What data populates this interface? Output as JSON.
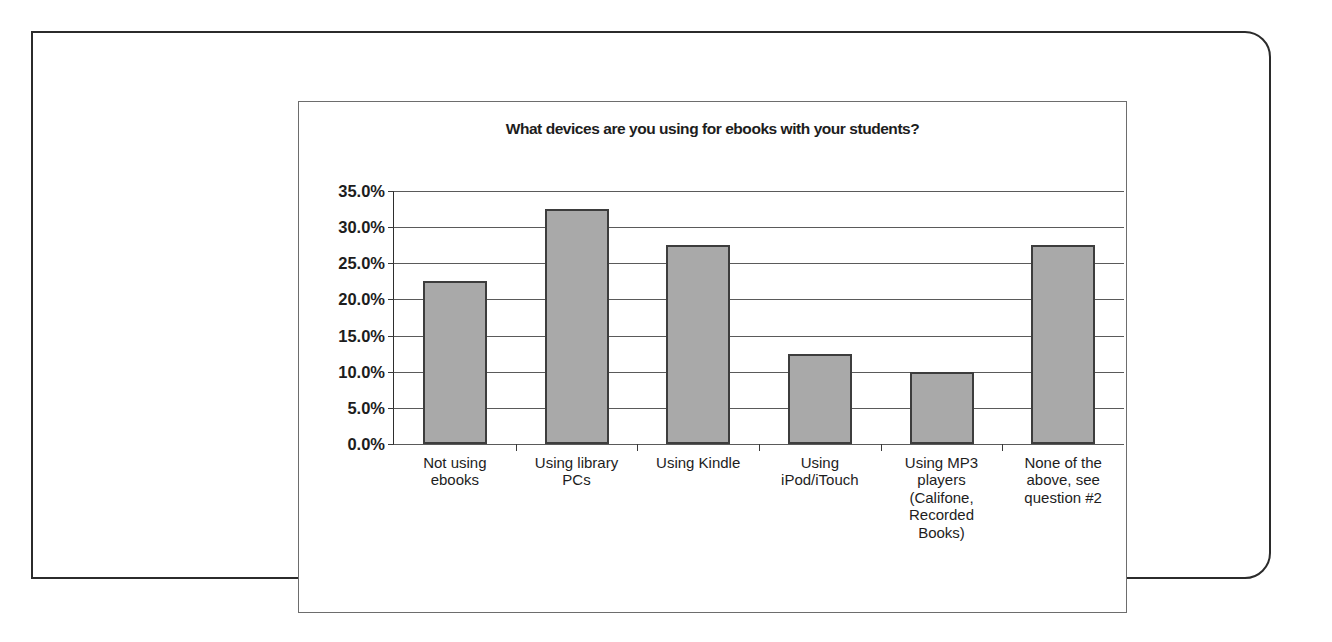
{
  "chart_data": {
    "type": "bar",
    "title": "What devices are you using for ebooks with your students?",
    "xlabel": "",
    "ylabel": "",
    "categories": [
      "Not using ebooks",
      "Using library PCs",
      "Using Kindle",
      "Using iPod/iTouch",
      "Using MP3 players (Califone, Recorded Books)",
      "None of the above, see question #2"
    ],
    "values": [
      22.5,
      32.5,
      27.5,
      12.5,
      10.0,
      27.5
    ],
    "value_labels": [
      "22.5%",
      "32.5%",
      "27.5%",
      "12.5%",
      "10.0%",
      "27.5%"
    ],
    "ylim": [
      0,
      35
    ],
    "ytick_values": [
      0,
      5,
      10,
      15,
      20,
      25,
      30,
      35
    ],
    "ytick_labels": [
      "0.0%",
      "5.0%",
      "10.0%",
      "15.0%",
      "20.0%",
      "25.0%",
      "30.0%",
      "35.0%"
    ],
    "grid": true,
    "legend": false,
    "legend_position": "none",
    "series": [
      {
        "name": "Percent of respondents",
        "values": [
          22.5,
          32.5,
          27.5,
          12.5,
          10.0,
          27.5
        ]
      }
    ],
    "colors": {
      "bar_fill": "#a9a9a9",
      "bar_border": "#3d3d3d",
      "gridline": "#5a5a5a",
      "axis": "#2e2e2e",
      "text": "#1d1d1d",
      "frame": "#6d6d6d",
      "page_border": "#2b2b2b",
      "background": "#ffffff"
    }
  }
}
